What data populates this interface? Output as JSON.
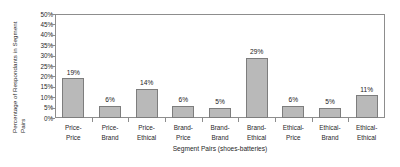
{
  "chart_data": {
    "type": "bar",
    "title": "",
    "xlabel": "Segment Pairs (shoes-batteries)",
    "ylabel": "Percentage of Respondants in Segment Pairs",
    "ylabel_line1": "Percentage of Respondants in Segment",
    "ylabel_line2": "Pairs",
    "categories": [
      "Price-Price",
      "Price-Brand",
      "Price-Ethical",
      "Brand-Price",
      "Brand-Brand",
      "Brand-Ethical",
      "Ethical-Price",
      "Ethical-Brand",
      "Ethical-Ethical"
    ],
    "category_lines": [
      [
        "Price-",
        "Price"
      ],
      [
        "Price-",
        "Brand"
      ],
      [
        "Price-",
        "Ethical"
      ],
      [
        "Brand-",
        "Price"
      ],
      [
        "Brand-",
        "Brand"
      ],
      [
        "Brand-",
        "Ethical"
      ],
      [
        "Ethical-",
        "Price"
      ],
      [
        "Ethical-",
        "Brand"
      ],
      [
        "Ethical-",
        "Ethical"
      ]
    ],
    "values": [
      19,
      6,
      14,
      6,
      5,
      29,
      6,
      5,
      11
    ],
    "value_labels": [
      "19%",
      "6%",
      "14%",
      "6%",
      "5%",
      "29%",
      "6%",
      "5%",
      "11%"
    ],
    "ylim": [
      0,
      50
    ],
    "ytick_values": [
      50,
      45,
      40,
      35,
      30,
      25,
      20,
      15,
      10,
      5,
      0
    ],
    "ytick_labels": [
      "50%",
      "45%",
      "40%",
      "35%",
      "30%",
      "25%",
      "20%",
      "15%",
      "10%",
      "5%",
      "0%"
    ],
    "grid": false,
    "legend": "none",
    "bar_color": "#b9b9b9",
    "bar_border_color": "#7d7d7d",
    "axis_color": "#8d8d8d",
    "text_color": "#1f1f1f"
  }
}
